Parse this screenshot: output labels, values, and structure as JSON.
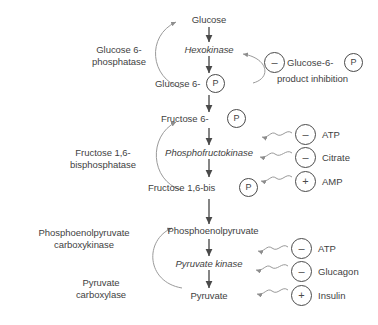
{
  "diagram": {
    "text_color": "#3f3f3f",
    "stroke_color": "#4a4a4a",
    "background": "#ffffff"
  },
  "pathway": {
    "step1": {
      "substrate": "Glucose",
      "enzyme": "Hexokinase",
      "product": "Glucose 6-",
      "product_tag": "P",
      "reverse_enzyme_line1": "Glucose 6-",
      "reverse_enzyme_line2": "phosphatase"
    },
    "step2": {
      "substrate": "Fructose 6-",
      "substrate_tag": "P",
      "enzyme": "Phosphofructokinase",
      "product": "Fructose 1,6-bis",
      "product_tag": "P",
      "reverse_enzyme_line1": "Fructose 1,6-",
      "reverse_enzyme_line2": "bisphosphatase"
    },
    "step3": {
      "substrate": "Phosphoenolpyruvate",
      "enzyme": "Pyruvate kinase",
      "product": "Pyruvate",
      "reverse_enzyme_a_line1": "Phosphoenolpyruvate",
      "reverse_enzyme_a_line2": "carboxykinase",
      "reverse_enzyme_b_line1": "Pyruvate",
      "reverse_enzyme_b_line2": "carboxylase"
    }
  },
  "regulators": {
    "hexokinase": {
      "sign": "–",
      "label_prefix": "Glucose-6-",
      "label_tag": "P",
      "caption": "product inhibition"
    },
    "pfk": [
      {
        "sign": "–",
        "name": "ATP"
      },
      {
        "sign": "–",
        "name": "Citrate"
      },
      {
        "sign": "+",
        "name": "AMP"
      }
    ],
    "pyruvate_kinase": [
      {
        "sign": "–",
        "name": "ATP"
      },
      {
        "sign": "–",
        "name": "Glucagon"
      },
      {
        "sign": "+",
        "name": "Insulin"
      }
    ]
  }
}
